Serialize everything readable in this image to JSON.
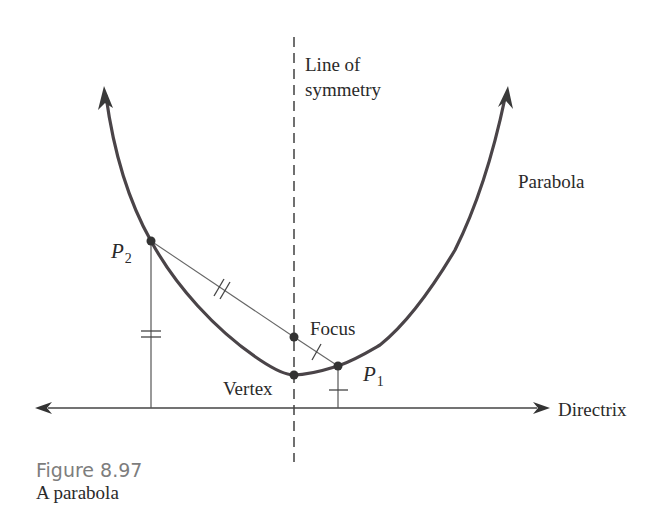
{
  "figure": {
    "number": "Figure 8.97",
    "caption": "A parabola"
  },
  "labels": {
    "axis_line1": "Line of",
    "axis_line2": "symmetry",
    "parabola": "Parabola",
    "focus": "Focus",
    "vertex": "Vertex",
    "directrix": "Directrix",
    "p1_main": "P",
    "p1_sub": "1",
    "p2_main": "P",
    "p2_sub": "2"
  },
  "colors": {
    "curve": "#4a4448",
    "lines": "#555555",
    "points": "#333333",
    "caption_number": "#7d7d7d"
  },
  "geometry": {
    "vertex": [
      294,
      375
    ],
    "focus": [
      294,
      337
    ],
    "p1": [
      338,
      366
    ],
    "p2": [
      151,
      241
    ],
    "directrix_y": 408
  }
}
